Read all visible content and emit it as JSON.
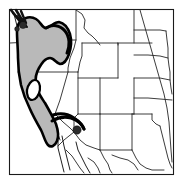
{
  "figure": {
    "kind": "distribution-range-map",
    "region": "Western North America",
    "title": "",
    "caption": "",
    "frame": {
      "visible": true,
      "x": 9,
      "y": 9,
      "width": 164,
      "height": 165,
      "stroke_color": "#1a1a1a"
    },
    "background_color": "#ffffff"
  },
  "legend": {
    "visible": false,
    "entries": [
      {
        "key": "shaded-range",
        "label": "Shaded distribution range",
        "swatch_color": "#b9b9b9",
        "outline_color": "#000000"
      },
      {
        "key": "locality-dot",
        "label": "Point locality record",
        "swatch_color": "#2b2b2b"
      }
    ]
  },
  "range": {
    "fill_color": "#b9b9b9",
    "outline_color": "#000000",
    "description": "Continuous shaded band from northwestern Washington south through the Coast Ranges and Sierra Nevada of California, east across the Columbia Plateau and northern Great Basin, with an unshaded interior gap over the California Central Valley and a narrow eastward arm toward southern Nevada.",
    "interior_gap": {
      "label": "Central Valley gap",
      "fill_color": "#ffffff"
    }
  },
  "localities": [
    {
      "id": "locality-southern-california",
      "label": "Southern California locality",
      "x": 77,
      "y": 130,
      "radius": 4.2,
      "color": "#2b2b2b"
    }
  ],
  "locality_clusters": [
    {
      "id": "cluster-puget-sound",
      "label": "Northwestern Washington cluster",
      "x": 19,
      "y": 19,
      "color": "#111111",
      "mark_count": 7
    }
  ],
  "states": [
    {
      "code": "WA",
      "name": "Washington"
    },
    {
      "code": "OR",
      "name": "Oregon"
    },
    {
      "code": "CA",
      "name": "California"
    },
    {
      "code": "ID",
      "name": "Idaho"
    },
    {
      "code": "NV",
      "name": "Nevada"
    },
    {
      "code": "MT",
      "name": "Montana"
    },
    {
      "code": "WY",
      "name": "Wyoming"
    },
    {
      "code": "UT",
      "name": "Utah"
    },
    {
      "code": "AZ",
      "name": "Arizona"
    },
    {
      "code": "CO",
      "name": "Colorado"
    },
    {
      "code": "NM",
      "name": "New Mexico"
    },
    {
      "code": "ND",
      "name": "North Dakota"
    },
    {
      "code": "SD",
      "name": "South Dakota"
    },
    {
      "code": "NE",
      "name": "Nebraska"
    },
    {
      "code": "KS",
      "name": "Kansas"
    },
    {
      "code": "OK",
      "name": "Oklahoma"
    },
    {
      "code": "TX",
      "name": "Texas"
    }
  ],
  "neighbors": [
    {
      "code": "MX",
      "name": "Mexico"
    }
  ]
}
